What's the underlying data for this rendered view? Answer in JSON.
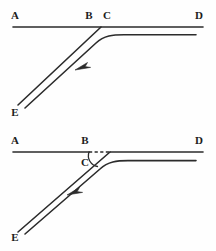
{
  "figure": {
    "background_color": "#fefefe",
    "stroke_color": "#2b2b2b",
    "width": 216,
    "height": 251
  },
  "panels": [
    {
      "id": "top-panel",
      "name": "upper-diagram",
      "description": "Junction with through line A-D and a ramp curving off at C down to E",
      "main_line": {
        "name": "line-a-d",
        "style": "solid",
        "from": [
          13,
          27
        ],
        "to": [
          203,
          27
        ],
        "labels": [
          "A",
          "B",
          "C",
          "D"
        ]
      },
      "ramp_straight": {
        "name": "ramp-straight-c-e",
        "style": "solid",
        "from": [
          101,
          27
        ],
        "to": [
          18,
          105
        ]
      },
      "ramp_curved": {
        "name": "ramp-curve-to-horizontal",
        "style": "solid",
        "from": [
          25,
          108
        ],
        "curve_to": [
          196,
          35
        ]
      },
      "arrow": {
        "name": "direction-arrow",
        "points_toward": "E",
        "tip": [
          75,
          70
        ]
      },
      "labels": [
        {
          "id": "A",
          "text": "A",
          "x": 15,
          "y": 16
        },
        {
          "id": "B",
          "text": "B",
          "x": 89,
          "y": 16
        },
        {
          "id": "C",
          "text": "C",
          "x": 106,
          "y": 16
        },
        {
          "id": "D",
          "text": "D",
          "x": 199,
          "y": 16
        },
        {
          "id": "E",
          "text": "E",
          "x": 15,
          "y": 113
        }
      ]
    },
    {
      "id": "bottom-panel",
      "name": "lower-diagram",
      "description": "Same junction with segment B-C drawn dashed and angle C marked with an arc",
      "main_line_solid_left": {
        "name": "line-a-b",
        "style": "solid",
        "from": [
          13,
          152
        ],
        "to": [
          88,
          152
        ]
      },
      "main_line_dashed": {
        "name": "line-b-c-dashed",
        "style": "dashed",
        "from": [
          88,
          152
        ],
        "to": [
          110,
          152
        ]
      },
      "main_line_solid_right": {
        "name": "line-c-d",
        "style": "solid",
        "from": [
          110,
          152
        ],
        "to": [
          203,
          152
        ]
      },
      "ramp_straight": {
        "name": "ramp-straight-c-e",
        "style": "solid",
        "from": [
          110,
          152
        ],
        "to": [
          18,
          232
        ]
      },
      "ramp_curved": {
        "name": "ramp-curve-to-horizontal",
        "style": "solid",
        "from": [
          25,
          234
        ],
        "curve_to": [
          196,
          160
        ]
      },
      "angle_arc": {
        "name": "angle-marker-c",
        "center_vertex": "C",
        "description": "arc from the horizontal line down to the ramp marking angle at C"
      },
      "arrow": {
        "name": "direction-arrow",
        "points_toward": "E",
        "tip": [
          67,
          195
        ]
      },
      "labels": [
        {
          "id": "A",
          "text": "A",
          "x": 15,
          "y": 141
        },
        {
          "id": "B",
          "text": "B",
          "x": 84,
          "y": 141
        },
        {
          "id": "C",
          "text": "C",
          "x": 85,
          "y": 162
        },
        {
          "id": "D",
          "text": "D",
          "x": 199,
          "y": 141
        },
        {
          "id": "E",
          "text": "E",
          "x": 15,
          "y": 238
        }
      ]
    }
  ]
}
